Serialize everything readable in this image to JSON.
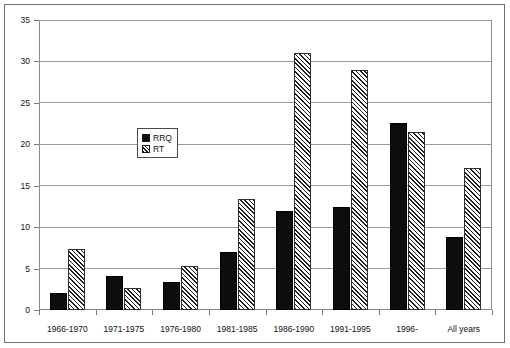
{
  "chart_data": {
    "type": "bar",
    "title": "",
    "subtitle": "",
    "xlabel": "",
    "ylabel": "",
    "categories": [
      "1966-1970",
      "1971-1975",
      "1976-1980",
      "1981-1985",
      "1986-1990",
      "1991-1995",
      "1996-",
      "All years"
    ],
    "series": [
      {
        "name": "RRQ",
        "values": [
          2.1,
          4.1,
          3.4,
          7.0,
          12.0,
          12.4,
          22.6,
          8.8
        ]
      },
      {
        "name": "RT",
        "values": [
          7.4,
          2.6,
          5.3,
          13.4,
          31.0,
          29.0,
          21.5,
          17.2
        ]
      }
    ],
    "ylim": [
      0,
      35
    ],
    "ytick_labels": [
      "0",
      "5",
      "10",
      "15",
      "20",
      "25",
      "30",
      "35"
    ],
    "ytick_values": [
      0,
      5,
      10,
      15,
      20,
      25,
      30,
      35
    ],
    "grid": true,
    "legend_position": "inside-upper-left",
    "legend_entries": [
      "RRQ",
      "RT"
    ],
    "colors": {
      "rrq_fill": "#0d0d0d",
      "rt_fill": "#ffffff",
      "rt_hatch": "#1f1f1f",
      "axis": "#7a7a7a",
      "grid": "#9a9a9a",
      "text": "#111111",
      "background": "#ffffff"
    }
  }
}
